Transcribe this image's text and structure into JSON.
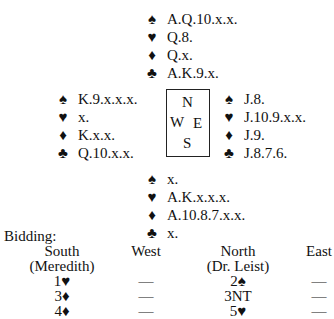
{
  "suits": {
    "spades": "♠",
    "hearts": "♥",
    "diamonds": "♦",
    "clubs": "♣"
  },
  "hands": {
    "north": {
      "spades": "A.Q.10.x.x.",
      "hearts": "Q.8.",
      "diamonds": "Q.x.",
      "clubs": "A.K.9.x."
    },
    "west": {
      "spades": "K.9.x.x.x.",
      "hearts": "x.",
      "diamonds": "K.x.x.",
      "clubs": "Q.10.x.x."
    },
    "east": {
      "spades": "J.8.",
      "hearts": "J.10.9.x.x.",
      "diamonds": "J.9.",
      "clubs": "J.8.7.6."
    },
    "south": {
      "spades": "x.",
      "hearts": "A.K.x.x.x.",
      "diamonds": "A.10.8.7.x.x.",
      "clubs": "x."
    }
  },
  "compass": {
    "n": "N",
    "w": "W",
    "e": "E",
    "s": "S"
  },
  "bidding": {
    "label": "Bidding:",
    "headers": [
      "South",
      "West",
      "North",
      "East"
    ],
    "subheaders": [
      "(Meredith)",
      "",
      "(Dr. Leist)",
      ""
    ],
    "rounds": [
      [
        "1♥",
        "—",
        "2♠",
        "—"
      ],
      [
        "3♦",
        "—",
        "3NT",
        "—"
      ],
      [
        "4♦",
        "—",
        "5♥",
        "—"
      ]
    ]
  }
}
